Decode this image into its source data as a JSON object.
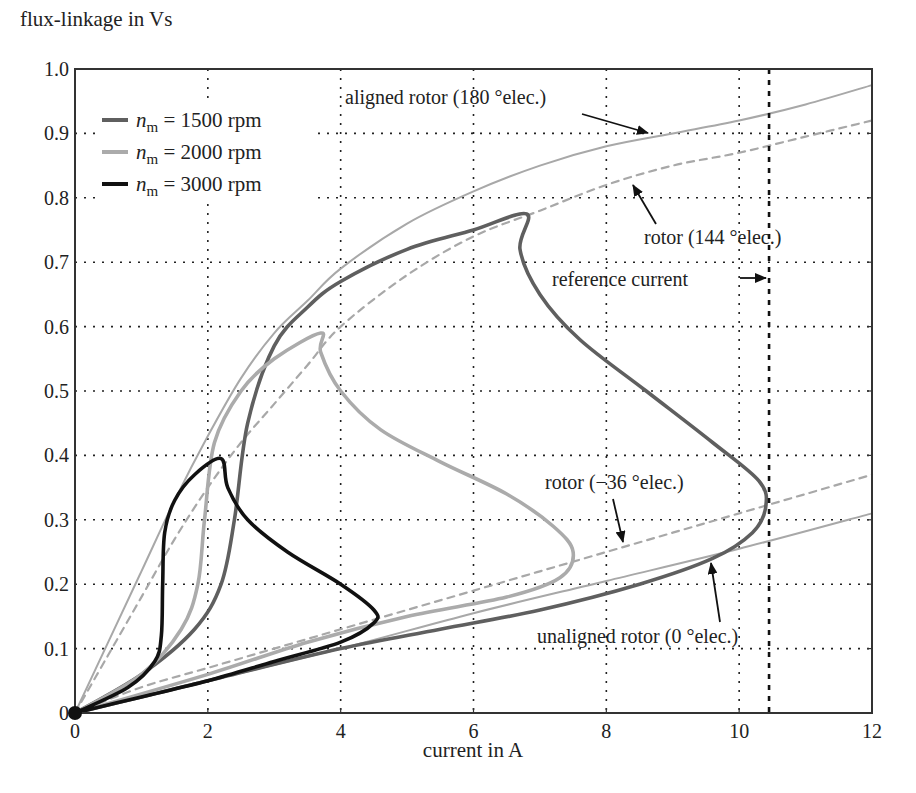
{
  "chart_data": {
    "type": "line",
    "title": "",
    "ylabel": "flux-linkage in Vs",
    "xlabel": "current in A",
    "xlim": [
      0,
      12
    ],
    "ylim": [
      0,
      1.0
    ],
    "xticks": [
      0,
      2,
      4,
      6,
      8,
      10,
      12
    ],
    "xtick_labels": [
      "0",
      "2",
      "4",
      "6",
      "8",
      "10",
      "12"
    ],
    "yticks": [
      0,
      0.1,
      0.2,
      0.3,
      0.4,
      0.5,
      0.6,
      0.7,
      0.8,
      0.9,
      1.0
    ],
    "ytick_labels": [
      "0",
      "0.1",
      "0.2",
      "0.3",
      "0.4",
      "0.5",
      "0.6",
      "0.7",
      "0.8",
      "0.9",
      "1.0"
    ],
    "grid": true,
    "legend_position": "upper left",
    "legend": [
      {
        "var": "n",
        "sub": "m",
        "text": " = 1500 rpm",
        "color": "#5f5f5f"
      },
      {
        "var": "n",
        "sub": "m",
        "text": " = 2000 rpm",
        "color": "#ababab"
      },
      {
        "var": "n",
        "sub": "m",
        "text": " = 3000 rpm",
        "color": "#111111"
      }
    ],
    "series": [
      {
        "name": "aligned rotor (180 °elec.)",
        "style": "solid-thin",
        "color": "#a8a8a8",
        "x": [
          0,
          0.5,
          1.0,
          1.5,
          2.0,
          2.5,
          3.0,
          3.5,
          4.0,
          5.0,
          6.0,
          7.0,
          8.0,
          9.0,
          10.0,
          11.0,
          12.0
        ],
        "y": [
          0,
          0.11,
          0.22,
          0.33,
          0.43,
          0.52,
          0.59,
          0.64,
          0.69,
          0.76,
          0.81,
          0.85,
          0.88,
          0.9,
          0.92,
          0.945,
          0.975
        ]
      },
      {
        "name": "rotor (144 °elec.)",
        "style": "dashed",
        "color": "#a8a8a8",
        "x": [
          0,
          0.5,
          1.0,
          1.5,
          2.0,
          2.5,
          3.0,
          3.5,
          4.0,
          5.0,
          6.0,
          7.0,
          8.0,
          9.0,
          10.0,
          11.0,
          12.0
        ],
        "y": [
          0,
          0.09,
          0.18,
          0.27,
          0.35,
          0.42,
          0.48,
          0.54,
          0.6,
          0.68,
          0.74,
          0.78,
          0.82,
          0.85,
          0.87,
          0.895,
          0.92
        ]
      },
      {
        "name": "rotor (-36 °elec.)",
        "style": "dashed",
        "color": "#a8a8a8",
        "x": [
          0,
          1,
          2,
          3,
          4,
          5,
          6,
          7,
          8,
          9,
          10,
          11,
          12
        ],
        "y": [
          0,
          0.04,
          0.07,
          0.1,
          0.13,
          0.16,
          0.19,
          0.22,
          0.25,
          0.28,
          0.31,
          0.34,
          0.37
        ]
      },
      {
        "name": "unaligned rotor (0 °elec.)",
        "style": "solid-thin",
        "color": "#a8a8a8",
        "x": [
          0,
          2,
          4,
          6,
          8,
          10,
          12
        ],
        "y": [
          0,
          0.05,
          0.1,
          0.155,
          0.205,
          0.255,
          0.31
        ]
      },
      {
        "name": "n_m = 1500 rpm",
        "style": "solid-thick",
        "color": "#5f5f5f",
        "x": [
          0,
          1.0,
          1.8,
          2.2,
          2.4,
          2.6,
          3.0,
          3.5,
          4.0,
          5.0,
          6.0,
          6.8,
          6.7,
          7.0,
          7.6,
          8.6,
          9.6,
          10.3,
          10.4,
          10.2,
          9.6,
          8.5,
          7.0,
          5.5,
          4.0,
          2.0,
          0
        ],
        "y": [
          0,
          0.06,
          0.13,
          0.2,
          0.3,
          0.45,
          0.57,
          0.63,
          0.67,
          0.72,
          0.75,
          0.775,
          0.72,
          0.65,
          0.58,
          0.5,
          0.42,
          0.36,
          0.32,
          0.28,
          0.24,
          0.2,
          0.16,
          0.13,
          0.1,
          0.05,
          0
        ]
      },
      {
        "name": "n_m = 2000 rpm",
        "style": "solid-thick",
        "color": "#ababab",
        "x": [
          0,
          1.0,
          1.6,
          1.85,
          1.95,
          2.1,
          2.5,
          3.0,
          3.7,
          3.7,
          4.0,
          4.6,
          5.5,
          6.5,
          7.2,
          7.5,
          7.3,
          6.5,
          5.0,
          3.5,
          2.0,
          0
        ],
        "y": [
          0,
          0.06,
          0.13,
          0.2,
          0.3,
          0.42,
          0.5,
          0.55,
          0.59,
          0.56,
          0.5,
          0.44,
          0.39,
          0.34,
          0.29,
          0.25,
          0.21,
          0.18,
          0.15,
          0.11,
          0.06,
          0
        ]
      },
      {
        "name": "n_m = 3000 rpm",
        "style": "solid-thick",
        "color": "#111111",
        "x": [
          0,
          0.8,
          1.2,
          1.3,
          1.32,
          1.35,
          1.5,
          1.8,
          2.2,
          2.3,
          2.6,
          3.2,
          4.0,
          4.5,
          4.5,
          4.0,
          3.0,
          2.0,
          1.0,
          0
        ],
        "y": [
          0,
          0.04,
          0.08,
          0.12,
          0.2,
          0.28,
          0.33,
          0.37,
          0.395,
          0.35,
          0.3,
          0.25,
          0.2,
          0.16,
          0.14,
          0.11,
          0.08,
          0.05,
          0.025,
          0
        ]
      }
    ],
    "reference_current": {
      "x": 10.45,
      "label": "reference current",
      "style": "dashed-thick"
    },
    "annotations": [
      {
        "text": "aligned rotor (180 °elec.)",
        "arrow_to": [
          8.6,
          0.905
        ]
      },
      {
        "text": "rotor (144 °elec.)",
        "arrow_to": [
          8.4,
          0.825
        ]
      },
      {
        "text": "reference current",
        "arrow_to": [
          10.4,
          0.675
        ]
      },
      {
        "text": "rotor (−36 °elec.)",
        "arrow_to": [
          8.1,
          0.235
        ]
      },
      {
        "text": "unaligned rotor (0 °elec.)",
        "arrow_to": [
          9.5,
          0.265
        ]
      }
    ]
  },
  "labels": {
    "ylabel": "flux-linkage in Vs",
    "xlabel": "current in A",
    "annot_aligned": "aligned rotor (180 °elec.)",
    "annot_144": "rotor (144 °elec.)",
    "annot_ref": "reference current",
    "annot_m36": "rotor (−36 °elec.)",
    "annot_unaligned": "unaligned rotor (0 °elec.)"
  }
}
